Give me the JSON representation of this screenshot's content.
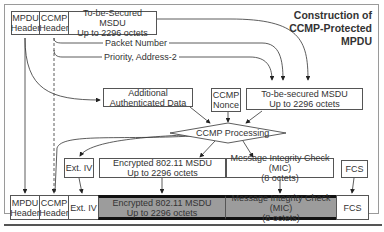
{
  "title": {
    "line1": "Construction of",
    "line2": "CCMP-Protected",
    "line3": "MPDU"
  },
  "input_row": {
    "mpdu_header": [
      "MPDU",
      "Header"
    ],
    "ccmp_header": [
      "CCMP",
      "Header"
    ],
    "msdu": [
      "To-be-Secured MSDU",
      "Up to 2296 octets"
    ]
  },
  "derived_labels": {
    "packet_number": "Packet Number",
    "priority_address": "Priority, Address-2"
  },
  "middle_row": {
    "aad": "Additional Authenticated Data",
    "ccmp_nonce": [
      "CCMP",
      "Nonce"
    ],
    "msdu": [
      "To-be-secured MSDU",
      "Up to 2296 octets"
    ]
  },
  "processing": {
    "label": "CCMP Processing"
  },
  "output_row": {
    "ext_iv": "Ext. IV",
    "encrypted": [
      "Encrypted 802.11 MSDU",
      "Up to 2296 octets"
    ],
    "mic": [
      "Message Integrity Check (MIC)",
      "(8 octets)"
    ],
    "fcs": "FCS"
  },
  "final_row": {
    "mpdu_header": [
      "MPDU",
      "Header"
    ],
    "ccmp_header": [
      "CCMP",
      "Header"
    ],
    "ext_iv": "Ext. IV",
    "encrypted": [
      "Encrypted 802.11 MSDU",
      "Up to 2296 octets"
    ],
    "mic": [
      "Message Integrity Check (MIC)",
      "(8 octets)"
    ],
    "fcs": "FCS"
  },
  "colors": {
    "encrypted_fill": "#9c9c9c",
    "border": "#555555",
    "band": "#111111"
  }
}
